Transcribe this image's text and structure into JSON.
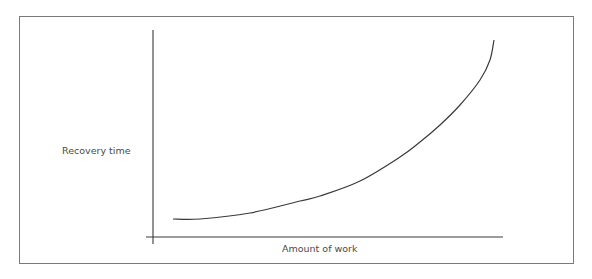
{
  "chart_data": {
    "type": "line",
    "title": "",
    "xlabel": "Amount of work",
    "ylabel": "Recovery time",
    "grid": false,
    "legend": null,
    "ticks": false,
    "series": [
      {
        "name": "Recovery time vs amount of work",
        "shape": "exponential-increasing",
        "points_px": [
          [
            173,
            219
          ],
          [
            200,
            219
          ],
          [
            250,
            213
          ],
          [
            300,
            201
          ],
          [
            320,
            196
          ],
          [
            360,
            181
          ],
          [
            400,
            157
          ],
          [
            420,
            142
          ],
          [
            440,
            125
          ],
          [
            460,
            105
          ],
          [
            480,
            80
          ],
          [
            490,
            60
          ],
          [
            494,
            40
          ]
        ]
      }
    ],
    "axes": {
      "origin_px": [
        153,
        237
      ],
      "x_end_px": 503,
      "y_top_px": 30
    }
  },
  "diagram": {
    "y_axis_label": "Recovery time",
    "x_axis_label": "Amount of work"
  }
}
